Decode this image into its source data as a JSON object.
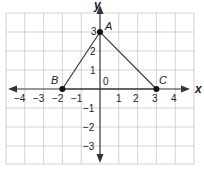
{
  "diagram": {
    "type": "coordinate-plane",
    "x_range": [
      -5,
      5
    ],
    "y_range": [
      -4,
      4
    ],
    "axis_labels": {
      "x": "x",
      "y": "y"
    },
    "origin_label": "0",
    "x_ticks": [
      "−4",
      "−3",
      "−2",
      "−1",
      "1",
      "2",
      "3",
      "4"
    ],
    "y_ticks": [
      "3",
      "2",
      "1",
      "−1",
      "−2",
      "−3"
    ],
    "points": [
      {
        "name": "A",
        "x": 0,
        "y": 3
      },
      {
        "name": "B",
        "x": -2,
        "y": 0
      },
      {
        "name": "C",
        "x": 3,
        "y": 0
      }
    ],
    "polygon": [
      "A",
      "B",
      "C"
    ],
    "colors": {
      "grid": "#c8c8c8",
      "axis": "#333333",
      "triangle": "#333333",
      "point": "#111111"
    }
  }
}
